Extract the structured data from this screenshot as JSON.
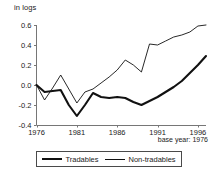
{
  "chart_data": {
    "type": "line",
    "title": "",
    "ylabel": "in logs",
    "xlabel": "",
    "annotation": "base year: 1976",
    "grid": false,
    "legend_position": "bottom",
    "xlim": [
      1976,
      1997
    ],
    "ylim": [
      -0.4,
      0.6
    ],
    "yticks": [
      "0.6",
      "0.4",
      "0.2",
      "0.0",
      "-0.2",
      "-0.4"
    ],
    "ytick_values": [
      0.6,
      0.4,
      0.2,
      0.0,
      -0.2,
      -0.4
    ],
    "xticks": [
      "1976",
      "1981",
      "1986",
      "1991",
      "1996"
    ],
    "xtick_values": [
      1976,
      1981,
      1986,
      1991,
      1996
    ],
    "x": [
      1976,
      1977,
      1978,
      1979,
      1980,
      1981,
      1982,
      1983,
      1984,
      1985,
      1986,
      1987,
      1988,
      1989,
      1990,
      1991,
      1992,
      1993,
      1994,
      1995,
      1996,
      1997
    ],
    "series": [
      {
        "name": "Tradables",
        "style": "thick",
        "color": "#111111",
        "values": [
          0.0,
          -0.07,
          -0.06,
          -0.05,
          -0.2,
          -0.31,
          -0.2,
          -0.08,
          -0.12,
          -0.13,
          -0.12,
          -0.13,
          -0.17,
          -0.2,
          -0.16,
          -0.12,
          -0.07,
          -0.02,
          0.04,
          0.12,
          0.2,
          0.29
        ]
      },
      {
        "name": "Non-tradables",
        "style": "thin",
        "color": "#111111",
        "values": [
          0.0,
          -0.15,
          -0.03,
          0.1,
          -0.04,
          -0.18,
          -0.07,
          -0.04,
          0.02,
          0.08,
          0.15,
          0.25,
          0.2,
          0.13,
          0.41,
          0.4,
          0.44,
          0.48,
          0.5,
          0.53,
          0.59,
          0.6
        ]
      }
    ]
  },
  "legend": {
    "tradables_label": "Tradables",
    "nontradables_label": "Non-tradables"
  }
}
